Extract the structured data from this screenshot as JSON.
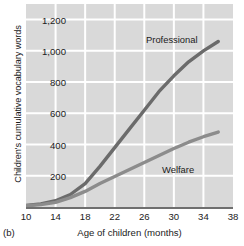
{
  "panel": {
    "label": "(b)"
  },
  "chart_data": {
    "type": "line",
    "title": "",
    "xlabel": "Age of children (months)",
    "ylabel": "Children's cumulative vocabulary words",
    "xlim": [
      10,
      38
    ],
    "ylim": [
      0,
      1300
    ],
    "xticks": [
      10,
      14,
      18,
      22,
      26,
      30,
      34,
      38
    ],
    "xtick_labels": [
      "10",
      "14",
      "18",
      "22",
      "26",
      "30",
      "34",
      "38"
    ],
    "yticks": [
      200,
      400,
      600,
      800,
      1000,
      1200
    ],
    "ytick_labels": [
      "200",
      "400",
      "600",
      "800",
      "1,000",
      "1,200"
    ],
    "grid": true,
    "grid_color": "#ffffff",
    "plot_background": "#d9d9d9",
    "legend_position": "inline-annotations",
    "series": [
      {
        "name": "Professional",
        "color": "#6b6b6b",
        "x": [
          10,
          12,
          14,
          16,
          18,
          20,
          22,
          24,
          26,
          28,
          30,
          32,
          34,
          36
        ],
        "values": [
          10,
          20,
          40,
          80,
          150,
          260,
          380,
          500,
          620,
          740,
          840,
          930,
          1000,
          1060
        ]
      },
      {
        "name": "Welfare",
        "color": "#8c8c8c",
        "x": [
          10,
          12,
          14,
          16,
          18,
          20,
          22,
          24,
          26,
          28,
          30,
          32,
          34,
          36
        ],
        "values": [
          8,
          15,
          30,
          60,
          100,
          150,
          195,
          240,
          285,
          330,
          375,
          415,
          450,
          480
        ]
      }
    ],
    "annotations": [
      {
        "text": "Professional",
        "x": 25.5,
        "y": 1090
      },
      {
        "text": "Welfare",
        "x": 27.5,
        "y": 245
      }
    ]
  }
}
